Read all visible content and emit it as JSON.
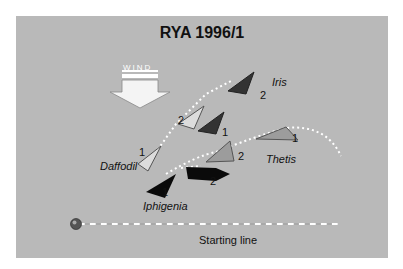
{
  "diagram": {
    "title": "RYA 1996/1",
    "wind_label": "WIND",
    "starting_line_label": "Starting line",
    "boats": [
      {
        "name": "Iris",
        "color": "#3a3a3a",
        "positions": [
          "1",
          "2"
        ]
      },
      {
        "name": "Daffodil",
        "color": "#d8d8d8",
        "positions": [
          "1",
          "2"
        ]
      },
      {
        "name": "Thetis",
        "color": "#9c9c9c",
        "positions": [
          "1",
          "2"
        ]
      },
      {
        "name": "Iphigenia",
        "color": "#0a0a0a",
        "positions": [
          "1",
          "2"
        ]
      }
    ],
    "colors": {
      "background": "#b9b9b9",
      "track": "#ffffff"
    }
  }
}
